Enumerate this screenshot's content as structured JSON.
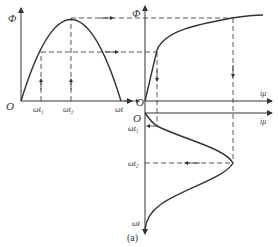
{
  "figure": {
    "caption": "(a)",
    "left_plot": {
      "y_axis_label": "Φ",
      "origin_label": "O",
      "x_ticks": [
        "ωt₁",
        "ωt₂",
        "ωt"
      ]
    },
    "right_top_plot": {
      "y_axis_label": "Φ",
      "origin_label": "O",
      "x_axis_label": "iμ"
    },
    "right_bottom_plot": {
      "origin_label": "O",
      "x_axis_label": "iμ",
      "y_ticks": [
        "ωt₁",
        "ωt₂",
        "ωt"
      ]
    }
  }
}
